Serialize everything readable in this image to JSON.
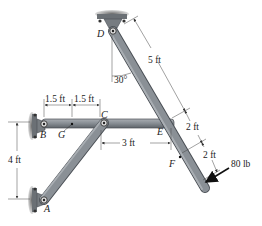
{
  "diagram": {
    "type": "statics-frame",
    "points": {
      "A": {
        "label": "A",
        "x": 44,
        "y": 200
      },
      "B": {
        "label": "B",
        "x": 44,
        "y": 126
      },
      "C": {
        "label": "C",
        "x": 104,
        "y": 123
      },
      "D": {
        "label": "D",
        "x": 113,
        "y": 31
      },
      "E": {
        "label": "E",
        "x": 172,
        "y": 122
      },
      "F": {
        "label": "F",
        "x": 189,
        "y": 172
      },
      "G": {
        "label": "G",
        "x": 72,
        "y": 124
      }
    },
    "members": [
      {
        "name": "BE",
        "from": "B",
        "to": "E"
      },
      {
        "name": "AC",
        "from": "A",
        "to": "C"
      },
      {
        "name": "D-end",
        "from": "D",
        "to": "end"
      }
    ],
    "dimensions": {
      "bg": "1.5 ft",
      "gc": "1.5 ft",
      "ce": "3 ft",
      "ab": "4 ft",
      "de": "5 ft",
      "ef": "2 ft",
      "f_load": "2 ft"
    },
    "angle": "30°",
    "load": {
      "label": "80 lb"
    },
    "colors": {
      "member_fill": "#8a9096",
      "member_edge": "#4a4f55",
      "support": "#5a5e63",
      "dim_line": "#444444"
    }
  }
}
